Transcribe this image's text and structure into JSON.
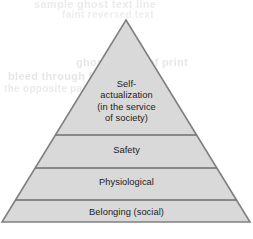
{
  "figure": {
    "kind": "hierarchy-of-needs-pyramid",
    "width": 253,
    "height": 239,
    "background_color": "#ffffff",
    "fill_color": "#d9d9d9",
    "outline_color": "#808080",
    "divider_color": "#6e6e6e",
    "text_color": "#1b1b1b"
  },
  "pyramid": {
    "apex": {
      "x": 126,
      "y": 20
    },
    "base_left": {
      "x": 2,
      "y": 222
    },
    "base_right": {
      "x": 250,
      "y": 222
    },
    "divider_y": [
      135,
      168,
      200
    ],
    "tiers": [
      {
        "id": "self-actualization",
        "level": 4,
        "lines": [
          "Self-",
          "actualization",
          "(in the service",
          "of society)"
        ]
      },
      {
        "id": "safety",
        "level": 3,
        "lines": [
          "Safety"
        ]
      },
      {
        "id": "physiological",
        "level": 2,
        "lines": [
          "Physiological"
        ]
      },
      {
        "id": "belonging",
        "level": 1,
        "lines": [
          "Belonging (social)"
        ]
      }
    ]
  },
  "bleed_through": {
    "note": "faint reverse-side scan artifacts, illegible",
    "lines": [
      "sample ghost text line",
      "faint reversed text",
      "ghosted line of print",
      "bleed through from",
      "the opposite page"
    ]
  }
}
